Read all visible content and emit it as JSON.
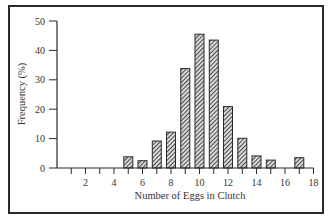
{
  "chart_data": {
    "type": "bar",
    "title": "",
    "xlabel": "Number of Eggs in Clutch",
    "ylabel": "Frequency (%)",
    "xlim": [
      0,
      18
    ],
    "ylim": [
      0,
      50
    ],
    "x_ticks_labeled": [
      2,
      4,
      6,
      8,
      10,
      12,
      14,
      16,
      18
    ],
    "x_ticks_minor": [
      1,
      3,
      5,
      7,
      9,
      11,
      13,
      15,
      17
    ],
    "y_ticks": [
      0,
      10,
      20,
      30,
      40,
      50
    ],
    "grid": false,
    "legend": null,
    "bar_fill": "diagonal-hatch",
    "categories": [
      5,
      6,
      7,
      8,
      9,
      10,
      11,
      12,
      13,
      14,
      15,
      17
    ],
    "values": [
      3.8,
      2.5,
      9.2,
      12.2,
      33.8,
      45.5,
      43.5,
      20.9,
      10.1,
      4.1,
      2.7,
      3.5
    ]
  },
  "colors": {
    "ink": "#2a2a2a",
    "background": "#ffffff"
  }
}
